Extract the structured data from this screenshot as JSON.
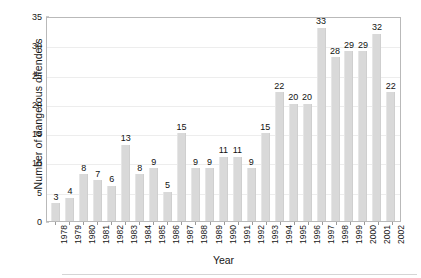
{
  "chart_data": {
    "type": "bar",
    "title": "",
    "subtitle": "",
    "xlabel": "Year",
    "ylabel": "Number of dangerous offenders",
    "categories": [
      "1978",
      "1979",
      "1980",
      "1981",
      "1982",
      "1983",
      "1984",
      "1985",
      "1986",
      "1987",
      "1988",
      "1989",
      "1990",
      "1991",
      "1992",
      "1993",
      "1994",
      "1995",
      "1996",
      "1997",
      "1998",
      "1999",
      "2000",
      "2001",
      "2002"
    ],
    "values": [
      3,
      4,
      8,
      7,
      6,
      13,
      8,
      9,
      5,
      15,
      9,
      9,
      11,
      11,
      9,
      15,
      22,
      20,
      20,
      33,
      28,
      29,
      29,
      32,
      22
    ],
    "series": [
      {
        "name": "Number of dangerous offenders",
        "values": [
          3,
          4,
          8,
          7,
          6,
          13,
          8,
          9,
          5,
          15,
          9,
          9,
          11,
          11,
          9,
          15,
          22,
          20,
          20,
          33,
          28,
          29,
          29,
          32,
          22
        ]
      }
    ],
    "ylim": [
      0,
      35
    ],
    "ytick_values": [
      0,
      5,
      10,
      15,
      20,
      25,
      30,
      35
    ],
    "ytick_labels": [
      "0",
      "5",
      "10",
      "15",
      "20",
      "25",
      "30",
      "35"
    ],
    "grid": true,
    "grid_axis": "y",
    "legend": false,
    "legend_position": "none",
    "data_labels": true,
    "bar_color": "#d9d9d9",
    "grid_color": "#ededed",
    "frame_color": "#b9b9b9",
    "text_color": "#161616"
  }
}
